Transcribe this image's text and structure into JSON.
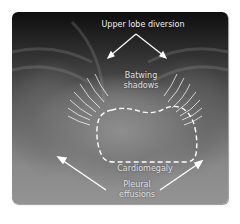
{
  "figure": {
    "type": "chest-xray-annotated",
    "labels": {
      "upper_lobe_diversion": "Upper lobe diversion",
      "batwing_line1": "Batwing",
      "batwing_line2": "shadows",
      "cardiomegaly": "Cardiomegaly",
      "pleural_line1": "Pleural",
      "pleural_line2": "effusions"
    },
    "annotation_color": "#ffffff",
    "background_color": "#ffffff"
  }
}
